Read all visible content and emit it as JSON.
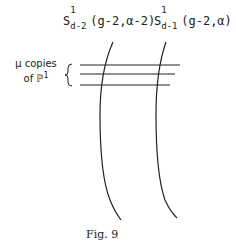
{
  "labels": {
    "curve1": {
      "base": "S",
      "sup": "1",
      "sub": "d-2",
      "args": "(g-2,α-2)"
    },
    "curve2": {
      "base": "S",
      "sup": "1",
      "sub": "d-1",
      "args": "(g-2,α)"
    },
    "copies_line1": "μ copies",
    "copies_line2": "of ℙ",
    "copies_sup": "1"
  },
  "caption": "Fig. 9",
  "colors": {
    "stroke": "#222222"
  }
}
